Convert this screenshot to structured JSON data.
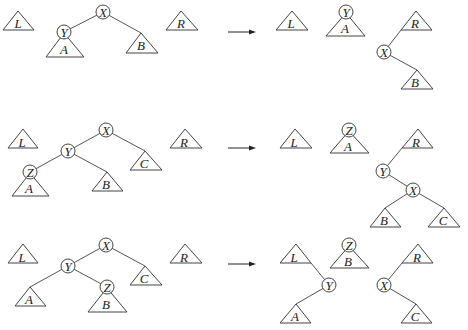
{
  "figure": {
    "rows": [
      {
        "case": "zig",
        "before": {
          "nodes": [
            {
              "id": "X",
              "label": "X"
            },
            {
              "id": "Y",
              "label": "Y"
            }
          ],
          "subtrees": [
            {
              "label": "L"
            },
            {
              "label": "A"
            },
            {
              "label": "B"
            },
            {
              "label": "R"
            }
          ]
        },
        "after": {
          "nodes": [
            {
              "label": "Y"
            },
            {
              "label": "X"
            }
          ],
          "subtrees": [
            {
              "label": "L"
            },
            {
              "label": "A"
            },
            {
              "label": "R"
            },
            {
              "label": "B"
            }
          ]
        }
      },
      {
        "case": "zig-zig",
        "before": {
          "nodes": [
            {
              "label": "X"
            },
            {
              "label": "Y"
            },
            {
              "label": "Z"
            }
          ],
          "subtrees": [
            {
              "label": "L"
            },
            {
              "label": "A"
            },
            {
              "label": "B"
            },
            {
              "label": "C"
            },
            {
              "label": "R"
            }
          ]
        },
        "after": {
          "nodes": [
            {
              "label": "Z"
            },
            {
              "label": "Y"
            },
            {
              "label": "X"
            }
          ],
          "subtrees": [
            {
              "label": "L"
            },
            {
              "label": "A"
            },
            {
              "label": "R"
            },
            {
              "label": "B"
            },
            {
              "label": "C"
            }
          ]
        }
      },
      {
        "case": "zig-zag",
        "before": {
          "nodes": [
            {
              "label": "X"
            },
            {
              "label": "Y"
            },
            {
              "label": "Z"
            }
          ],
          "subtrees": [
            {
              "label": "L"
            },
            {
              "label": "A"
            },
            {
              "label": "B"
            },
            {
              "label": "C"
            },
            {
              "label": "R"
            }
          ]
        },
        "after": {
          "nodes": [
            {
              "label": "Z"
            },
            {
              "label": "Y"
            },
            {
              "label": "X"
            }
          ],
          "subtrees": [
            {
              "label": "L"
            },
            {
              "label": "A"
            },
            {
              "label": "B"
            },
            {
              "label": "R"
            },
            {
              "label": "C"
            }
          ]
        }
      }
    ],
    "labels": {
      "L": "L",
      "R": "R",
      "A": "A",
      "B": "B",
      "C": "C",
      "X": "X",
      "Y": "Y",
      "Z": "Z"
    }
  }
}
